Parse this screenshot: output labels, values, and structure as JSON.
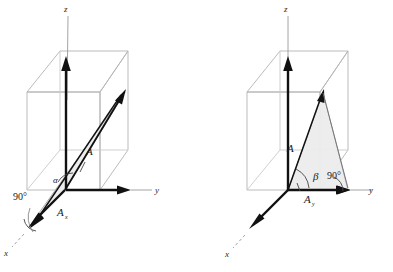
{
  "figure": {
    "type": "diagram",
    "background_color": "#ffffff",
    "box_line_color": "#b3b3b3",
    "vector_color": "#111111",
    "shade_fill": "#ececed",
    "shade_stroke": "#8c8c8c"
  },
  "panels": [
    {
      "id": "left",
      "name": "alpha-panel",
      "description": "Vector A and its x-component A_x, with angle alpha between A and A_x and a 90 degree right angle mark at the x-axis",
      "axes": [
        {
          "name": "z-axis",
          "label": "z"
        },
        {
          "name": "y-axis",
          "label": "y"
        },
        {
          "name": "x-axis",
          "label": "x"
        }
      ],
      "labels": {
        "vector": "A",
        "component": "A",
        "component_sub": "x",
        "angle": "α",
        "right_angle": "90°"
      }
    },
    {
      "id": "right",
      "name": "beta-panel",
      "description": "Vector A and its y-component A_y, with angle beta between A and A_y and a 90 degree right angle mark at the y-axis",
      "axes": [
        {
          "name": "z-axis",
          "label": "z"
        },
        {
          "name": "y-axis",
          "label": "y"
        },
        {
          "name": "x-axis",
          "label": "x"
        }
      ],
      "labels": {
        "vector": "A",
        "component": "A",
        "component_sub": "y",
        "angle": "β",
        "right_angle": "90°"
      }
    }
  ]
}
